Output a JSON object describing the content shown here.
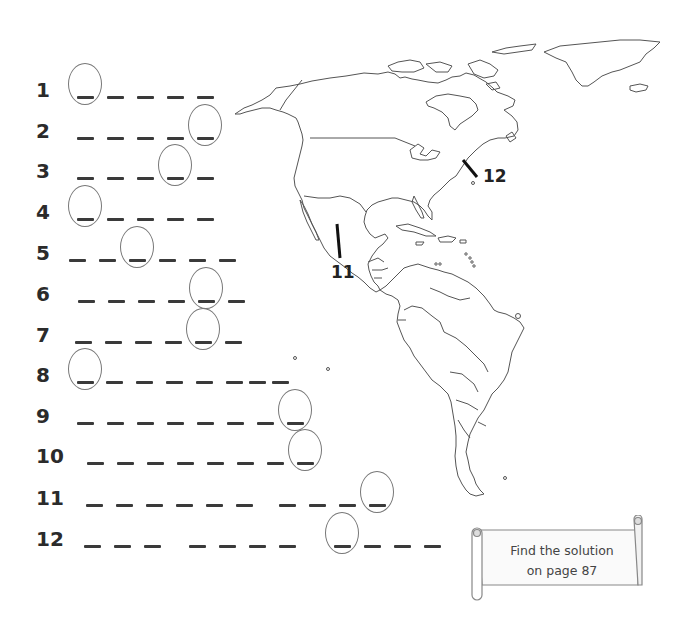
{
  "puzzle": {
    "rows": [
      {
        "number": "1",
        "y": 96,
        "blanks": [
          77,
          107,
          137,
          167,
          197
        ],
        "circle_index": 0
      },
      {
        "number": "2",
        "y": 137,
        "blanks": [
          77,
          107,
          137,
          167,
          197
        ],
        "circle_index": 4
      },
      {
        "number": "3",
        "y": 177,
        "blanks": [
          77,
          107,
          137,
          167,
          197
        ],
        "circle_index": 3
      },
      {
        "number": "4",
        "y": 218,
        "blanks": [
          77,
          107,
          137,
          167,
          197
        ],
        "circle_index": 0
      },
      {
        "number": "5",
        "y": 259,
        "blanks": [
          69,
          99,
          129,
          159,
          189,
          219
        ],
        "circle_index": 2
      },
      {
        "number": "6",
        "y": 300,
        "blanks": [
          78,
          108,
          138,
          168,
          198,
          228
        ],
        "circle_index": 4
      },
      {
        "number": "7",
        "y": 341,
        "blanks": [
          75,
          105,
          135,
          165,
          195,
          225
        ],
        "circle_index": 4
      },
      {
        "number": "8",
        "y": 381,
        "blanks": [
          77,
          106,
          136,
          166,
          196,
          226,
          249,
          272
        ],
        "circle_index": 0
      },
      {
        "number": "9",
        "y": 422,
        "blanks": [
          77,
          107,
          137,
          167,
          197,
          227,
          257,
          287
        ],
        "circle_index": 7
      },
      {
        "number": "10",
        "y": 462,
        "blanks": [
          87,
          117,
          147,
          177,
          207,
          237,
          267,
          297
        ],
        "circle_index": 7
      },
      {
        "number": "11",
        "y": 504,
        "blanks": [
          86,
          116,
          146,
          176,
          206,
          236,
          279,
          309,
          339,
          369
        ],
        "circle_index": 9
      },
      {
        "number": "12",
        "y": 545,
        "blanks": [
          84,
          114,
          144,
          189,
          219,
          249,
          279,
          334,
          364,
          394,
          424
        ],
        "circle_index": 7
      }
    ]
  },
  "map": {
    "labels": [
      {
        "id": "11",
        "text": "11",
        "x": 331,
        "y": 262
      },
      {
        "id": "12",
        "text": "12",
        "x": 483,
        "y": 166
      }
    ]
  },
  "scroll": {
    "line1": "Find the solution",
    "line2": "on page 87"
  },
  "colors": {
    "ink": "#3a3a3a",
    "outline": "#555555",
    "circle": "#777777"
  }
}
